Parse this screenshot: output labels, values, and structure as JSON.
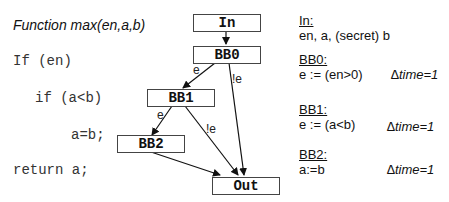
{
  "code": {
    "title": "Function max(en,a,b)",
    "lines": [
      "If (en)",
      "if (a<b)",
      "a=b;",
      "return a;"
    ]
  },
  "cfg": {
    "nodes": {
      "in": "In",
      "bb0": "BB0",
      "bb1": "BB1",
      "bb2": "BB2",
      "out": "Out"
    },
    "edge_labels": {
      "bb0_bb1": "e",
      "bb0_out": "!e",
      "bb1_bb2": "e",
      "bb1_out": "!e"
    }
  },
  "info": {
    "in": {
      "heading": "In:",
      "text": "en, a, (secret) b"
    },
    "bb0": {
      "heading": "BB0:",
      "text": "e := (en>0)",
      "dtime": "∆time=1"
    },
    "bb1": {
      "heading": "BB1:",
      "text": "e := (a<b)",
      "dtime": "∆time=1"
    },
    "bb2": {
      "heading": "BB2:",
      "text": "a:=b",
      "dtime": "∆time=1"
    }
  }
}
